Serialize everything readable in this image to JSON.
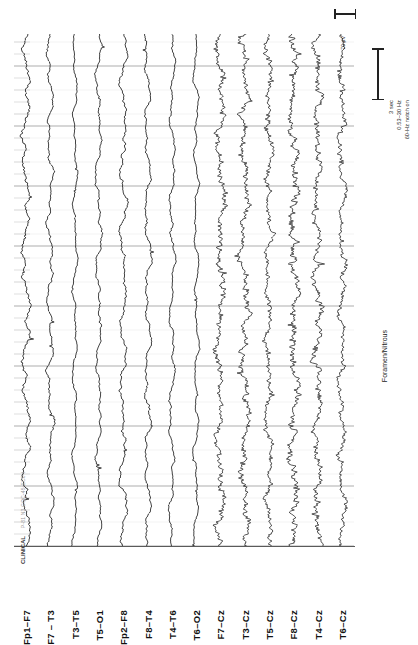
{
  "recording": {
    "type": "eeg-page",
    "orientation": "rotated-90",
    "channel_count": 14,
    "event_annotation": "Foramen/Nitrous",
    "recorder_header": "P-81  N3  COC-45-EC0 I",
    "recorder_id": "CLINICAL"
  },
  "calibration": {
    "duration_label": "3 sec",
    "filter_label": "0.53–30 Hz",
    "notch_label": "60-Hz notch on",
    "amplitude_label": "70 µV"
  },
  "channels": [
    {
      "label": "Fp1–F7",
      "group": "bipolar-left",
      "amplitude": 5.8,
      "roughness": 0.3,
      "hf": 0.18
    },
    {
      "label": "F7 – T3",
      "group": "bipolar-left",
      "amplitude": 4.6,
      "roughness": 0.28,
      "hf": 0.16
    },
    {
      "label": "T3–T5",
      "group": "bipolar-left",
      "amplitude": 3.4,
      "roughness": 0.24,
      "hf": 0.14
    },
    {
      "label": "T5–O1",
      "group": "bipolar-left",
      "amplitude": 4.2,
      "roughness": 0.26,
      "hf": 0.15
    },
    {
      "label": "Fp2–F8",
      "group": "bipolar-right",
      "amplitude": 5.2,
      "roughness": 0.3,
      "hf": 0.17
    },
    {
      "label": "F8–T4",
      "group": "bipolar-right",
      "amplitude": 4.8,
      "roughness": 0.28,
      "hf": 0.16
    },
    {
      "label": "T4–T6",
      "group": "bipolar-right",
      "amplitude": 4.0,
      "roughness": 0.26,
      "hf": 0.15
    },
    {
      "label": "T6–O2",
      "group": "bipolar-right",
      "amplitude": 3.6,
      "roughness": 0.24,
      "hf": 0.14
    },
    {
      "label": "F7–Cz",
      "group": "referential-cz",
      "amplitude": 5.0,
      "roughness": 0.62,
      "hf": 0.78
    },
    {
      "label": "T3–Cz",
      "group": "referential-cz",
      "amplitude": 5.4,
      "roughness": 0.66,
      "hf": 0.84
    },
    {
      "label": "T5–Cz",
      "group": "referential-cz",
      "amplitude": 4.6,
      "roughness": 0.6,
      "hf": 0.76
    },
    {
      "label": "F8–Cz",
      "group": "referential-cz",
      "amplitude": 5.6,
      "roughness": 0.68,
      "hf": 0.86
    },
    {
      "label": "T4–Cz",
      "group": "referential-cz",
      "amplitude": 5.0,
      "roughness": 0.64,
      "hf": 0.8
    },
    {
      "label": "T6–Cz",
      "group": "referential-cz",
      "amplitude": 4.4,
      "roughness": 0.58,
      "hf": 0.74
    }
  ],
  "grid": {
    "minor_tick_spacing_px": 12,
    "major_gridline_every_n_minor": 5,
    "minor_color": "#c9c9c9",
    "major_color": "#8a8a8a",
    "baseline_color": "#5a5a5a",
    "trace_color": "#181818"
  }
}
